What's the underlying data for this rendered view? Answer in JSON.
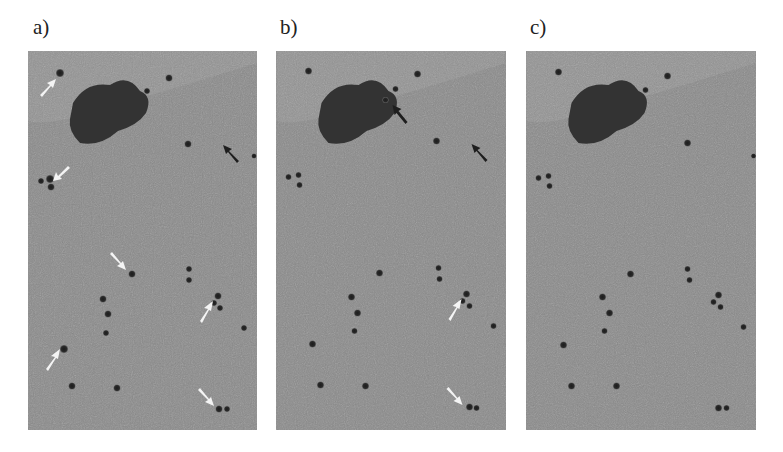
{
  "figure": {
    "panels": [
      {
        "id": "a",
        "label": "a)"
      },
      {
        "id": "b",
        "label": "b)"
      },
      {
        "id": "c",
        "label": "c)"
      }
    ],
    "colors": {
      "background": "#8a8a8a",
      "cell": "#2e2e2e",
      "large_object": "#333333",
      "arrow_white": "#f4f4f4",
      "arrow_black": "#1e1e1e"
    },
    "annotations": {
      "a": {
        "white_arrows": 6,
        "black_arrows": 1
      },
      "b": {
        "white_arrows": 2,
        "black_arrows": 2
      },
      "c": {
        "white_arrows": 0,
        "black_arrows": 0
      }
    }
  }
}
